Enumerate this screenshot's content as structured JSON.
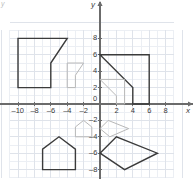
{
  "figure": {
    "kind": "coordinate-plane",
    "background_color": "#ffffff",
    "grid_color": "#dfe3ea",
    "axis_color": "#6b6b6b",
    "preimage_color": "#3b3b3b",
    "image_color": "#b8b8b8",
    "corner_mark": "y"
  },
  "axes": {
    "x_name": "x",
    "y_name": "y",
    "x_min": -11,
    "x_max": 9,
    "y_min": -9,
    "y_max": 9,
    "x_ticks": [
      {
        "value": -10,
        "label": "–10"
      },
      {
        "value": -8,
        "label": "–8"
      },
      {
        "value": -6,
        "label": "–6"
      },
      {
        "value": -4,
        "label": "–4"
      },
      {
        "value": -2,
        "label": "–2"
      },
      {
        "value": 0,
        "label": "0"
      },
      {
        "value": 2,
        "label": "2"
      },
      {
        "value": 4,
        "label": "4"
      },
      {
        "value": 6,
        "label": "6"
      },
      {
        "value": 8,
        "label": "8"
      }
    ],
    "y_ticks": [
      {
        "value": 8,
        "label": "8"
      },
      {
        "value": 6,
        "label": "6"
      },
      {
        "value": 4,
        "label": "4"
      },
      {
        "value": 2,
        "label": "2"
      },
      {
        "value": -2,
        "label": "–2"
      },
      {
        "value": -4,
        "label": "–4"
      },
      {
        "value": -6,
        "label": "–6"
      },
      {
        "value": -8,
        "label": "–8"
      }
    ]
  },
  "chart_data": {
    "type": "scatter",
    "title": "",
    "xlabel": "x",
    "ylabel": "y",
    "xlim": [
      -11,
      9
    ],
    "ylim": [
      -9,
      9
    ],
    "grid": true,
    "legend": "none",
    "shapes": [
      {
        "name": "quadrant-2-notched-rectangle-preimage",
        "role": "preimage",
        "color": "#3b3b3b",
        "closed": true,
        "points": [
          [
            -10,
            8
          ],
          [
            -4,
            8
          ],
          [
            -6,
            5
          ],
          [
            -6,
            2
          ],
          [
            -10,
            2
          ]
        ]
      },
      {
        "name": "quadrant-2-notched-rectangle-image",
        "role": "image",
        "color": "#b8b8b8",
        "closed": true,
        "points": [
          [
            -4,
            5
          ],
          [
            -2,
            5
          ],
          [
            -3,
            3.5
          ],
          [
            -3,
            2
          ],
          [
            -4,
            2
          ]
        ]
      },
      {
        "name": "quadrant-1-notched-rectangle-preimage",
        "role": "preimage",
        "color": "#3b3b3b",
        "closed": true,
        "points": [
          [
            0,
            6
          ],
          [
            6,
            6
          ],
          [
            6,
            0
          ],
          [
            4,
            0
          ],
          [
            4,
            2
          ]
        ]
      },
      {
        "name": "quadrant-1-notched-rectangle-image",
        "role": "image",
        "color": "#b8b8b8",
        "closed": true,
        "points": [
          [
            0,
            3
          ],
          [
            3,
            3
          ],
          [
            3,
            0
          ],
          [
            2,
            0
          ],
          [
            2,
            1
          ]
        ]
      },
      {
        "name": "quadrant-3-pentagon-preimage",
        "role": "preimage",
        "color": "#3b3b3b",
        "closed": true,
        "points": [
          [
            -7,
            -8
          ],
          [
            -3,
            -8
          ],
          [
            -3,
            -5.5
          ],
          [
            -5,
            -4
          ],
          [
            -7,
            -5.5
          ]
        ]
      },
      {
        "name": "quadrant-3-pentagon-image",
        "role": "image",
        "color": "#b8b8b8",
        "closed": true,
        "points": [
          [
            -3,
            -4
          ],
          [
            -1,
            -4
          ],
          [
            -1,
            -2.8
          ],
          [
            -2,
            -2
          ],
          [
            -3,
            -2.8
          ]
        ]
      },
      {
        "name": "quadrant-4-kite-preimage",
        "role": "preimage",
        "color": "#3b3b3b",
        "closed": true,
        "points": [
          [
            0,
            -6
          ],
          [
            2,
            -4
          ],
          [
            7,
            -6
          ],
          [
            3,
            -8
          ]
        ]
      },
      {
        "name": "quadrant-4-kite-image",
        "role": "image",
        "color": "#b8b8b8",
        "closed": true,
        "points": [
          [
            0,
            -3
          ],
          [
            1,
            -2
          ],
          [
            3.5,
            -3
          ],
          [
            1.2,
            -4
          ]
        ]
      }
    ]
  }
}
